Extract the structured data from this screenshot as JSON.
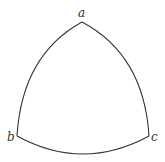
{
  "diagram": {
    "type": "reuleaux-like curved triangle",
    "stroke_color": "#333333",
    "background": "#ffffff",
    "vertices": [
      {
        "id": "a",
        "label": "a",
        "x": 82,
        "y": 22,
        "label_x": 78,
        "label_y": 17
      },
      {
        "id": "b",
        "label": "b",
        "x": 17,
        "y": 136,
        "label_x": 7,
        "label_y": 141
      },
      {
        "id": "c",
        "label": "c",
        "x": 149,
        "y": 136,
        "label_x": 151,
        "label_y": 141
      }
    ],
    "edges": [
      {
        "from": "a",
        "to": "b",
        "shape": "arc-convex-outward"
      },
      {
        "from": "a",
        "to": "c",
        "shape": "arc-convex-outward"
      },
      {
        "from": "b",
        "to": "c",
        "shape": "arc-convex-outward"
      }
    ]
  }
}
